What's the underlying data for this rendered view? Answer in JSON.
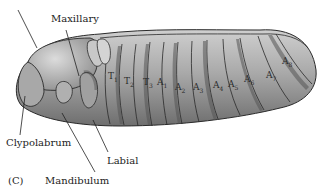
{
  "figure": {
    "panel": "(C)",
    "colors": {
      "body": "#9a9a9a",
      "outline": "#2a2a2a",
      "band": "#5a5a5a",
      "highlight": "#d8d8d8"
    }
  },
  "labels": {
    "maxillary": "Maxillary",
    "clypolabrum": "Clypolabrum",
    "labial": "Labial",
    "mandibulum": "Mandibulum",
    "panel": "(C)"
  },
  "segments": [
    {
      "base": "T",
      "sub": "1"
    },
    {
      "base": "T",
      "sub": "2"
    },
    {
      "base": "T",
      "sub": "3"
    },
    {
      "base": "A",
      "sub": "1"
    },
    {
      "base": "A",
      "sub": "2"
    },
    {
      "base": "A",
      "sub": "3"
    },
    {
      "base": "A",
      "sub": "4"
    },
    {
      "base": "A",
      "sub": "5"
    },
    {
      "base": "A",
      "sub": "6"
    },
    {
      "base": "A",
      "sub": "7"
    },
    {
      "base": "A",
      "sub": "8"
    }
  ]
}
